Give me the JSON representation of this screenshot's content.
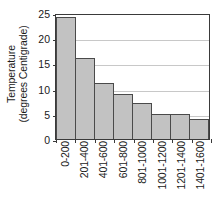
{
  "chart_data": {
    "type": "bar",
    "title": "",
    "xlabel": "",
    "ylabel": "Temperature (degrees Centigrade)",
    "ylabel_line1": "Temperature",
    "ylabel_line2": "(degrees Centigrade)",
    "categories": [
      "0-200",
      "201-400",
      "401-600",
      "601-800",
      "801-1000",
      "1001-1200",
      "1201-1400",
      "1401-1600"
    ],
    "values": [
      24.3,
      16.1,
      11.1,
      9.0,
      7.1,
      5.0,
      5.0,
      4.0
    ],
    "ylim": [
      0,
      25
    ],
    "yticks": [
      0,
      5,
      10,
      15,
      20,
      25
    ],
    "ytick_labels": [
      "0",
      "5",
      "10",
      "15",
      "20",
      "25"
    ],
    "grid": true,
    "legend": false,
    "bar_fill_color": "#c2c2c2",
    "bar_edge_color": "#4a4a4a",
    "axis_color": "#3a3a3a",
    "grid_color": "#c8c8c8",
    "background_color": "#ffffff"
  },
  "title_remnant": "·"
}
